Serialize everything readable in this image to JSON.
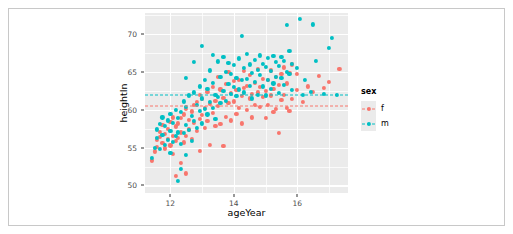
{
  "chart_data": {
    "type": "scatter",
    "title": "",
    "xlabel": "ageYear",
    "ylabel": "heightIn",
    "xlim": [
      11.2,
      17.6
    ],
    "ylim": [
      49.0,
      72.8
    ],
    "xticks": [
      12,
      14,
      16
    ],
    "yticks": [
      50,
      55,
      60,
      65,
      70
    ],
    "grid": true,
    "panel_color": "#ebebeb",
    "grid_color": "#ffffff",
    "legend": {
      "title": "sex",
      "position": "right",
      "entries": [
        {
          "label": "f",
          "color": "#f8766d"
        },
        {
          "label": "m",
          "color": "#00bfc4"
        }
      ]
    },
    "annotations": [
      {
        "kind": "hline",
        "series": "m",
        "y": 62.0,
        "style": "dashed",
        "color": "#00bfc4"
      },
      {
        "kind": "hline",
        "series": "f",
        "y": 60.5,
        "style": "dashed",
        "color": "#f8766d"
      }
    ],
    "series": [
      {
        "name": "f",
        "color": "#f8766d",
        "points": [
          [
            11.42,
            53.3
          ],
          [
            11.5,
            54.5
          ],
          [
            11.58,
            55.1
          ],
          [
            11.58,
            56.0
          ],
          [
            11.67,
            56.4
          ],
          [
            11.67,
            57.1
          ],
          [
            11.75,
            55.6
          ],
          [
            11.75,
            58.0
          ],
          [
            11.83,
            54.9
          ],
          [
            11.83,
            56.8
          ],
          [
            11.92,
            56.2
          ],
          [
            11.92,
            57.5
          ],
          [
            12.0,
            55.3
          ],
          [
            12.0,
            58.4
          ],
          [
            12.08,
            54.2
          ],
          [
            12.08,
            56.6
          ],
          [
            12.08,
            59.0
          ],
          [
            12.17,
            51.3
          ],
          [
            12.17,
            55.9
          ],
          [
            12.17,
            57.8
          ],
          [
            12.25,
            56.3
          ],
          [
            12.25,
            58.2
          ],
          [
            12.33,
            53.0
          ],
          [
            12.33,
            57.0
          ],
          [
            12.33,
            58.9
          ],
          [
            12.42,
            55.7
          ],
          [
            12.42,
            59.4
          ],
          [
            12.5,
            51.6
          ],
          [
            12.5,
            56.5
          ],
          [
            12.5,
            60.1
          ],
          [
            12.58,
            57.4
          ],
          [
            12.58,
            58.7
          ],
          [
            12.67,
            56.1
          ],
          [
            12.67,
            59.8
          ],
          [
            12.75,
            58.3
          ],
          [
            12.75,
            60.6
          ],
          [
            12.83,
            57.2
          ],
          [
            12.83,
            61.0
          ],
          [
            12.92,
            54.6
          ],
          [
            12.92,
            58.8
          ],
          [
            12.92,
            62.0
          ],
          [
            13.0,
            59.3
          ],
          [
            13.0,
            61.4
          ],
          [
            13.08,
            57.6
          ],
          [
            13.08,
            60.2
          ],
          [
            13.17,
            58.5
          ],
          [
            13.17,
            62.4
          ],
          [
            13.25,
            55.4
          ],
          [
            13.25,
            60.8
          ],
          [
            13.33,
            59.6
          ],
          [
            13.33,
            63.0
          ],
          [
            13.42,
            57.9
          ],
          [
            13.42,
            61.2
          ],
          [
            13.5,
            60.5
          ],
          [
            13.5,
            64.3
          ],
          [
            13.58,
            58.1
          ],
          [
            13.58,
            62.7
          ],
          [
            13.67,
            55.2
          ],
          [
            13.67,
            61.6
          ],
          [
            13.75,
            59.1
          ],
          [
            13.75,
            63.4
          ],
          [
            13.83,
            60.9
          ],
          [
            13.83,
            65.0
          ],
          [
            13.92,
            58.6
          ],
          [
            13.92,
            62.2
          ],
          [
            14.0,
            61.1
          ],
          [
            14.0,
            63.8
          ],
          [
            14.08,
            59.5
          ],
          [
            14.08,
            62.6
          ],
          [
            14.17,
            60.3
          ],
          [
            14.17,
            64.0
          ],
          [
            14.25,
            58.2
          ],
          [
            14.25,
            61.8
          ],
          [
            14.33,
            62.9
          ],
          [
            14.33,
            65.1
          ],
          [
            14.42,
            60.0
          ],
          [
            14.42,
            63.2
          ],
          [
            14.5,
            61.5
          ],
          [
            14.5,
            64.6
          ],
          [
            14.58,
            59.0
          ],
          [
            14.58,
            62.1
          ],
          [
            14.67,
            60.7
          ],
          [
            14.67,
            63.6
          ],
          [
            14.75,
            62.3
          ],
          [
            14.75,
            65.4
          ],
          [
            14.83,
            60.4
          ],
          [
            14.83,
            63.0
          ],
          [
            14.92,
            61.7
          ],
          [
            14.92,
            64.1
          ],
          [
            15.0,
            58.9
          ],
          [
            15.0,
            62.5
          ],
          [
            15.08,
            60.6
          ],
          [
            15.08,
            63.9
          ],
          [
            15.17,
            61.9
          ],
          [
            15.17,
            65.2
          ],
          [
            15.25,
            59.7
          ],
          [
            15.25,
            62.8
          ],
          [
            15.33,
            60.1
          ],
          [
            15.33,
            64.4
          ],
          [
            15.42,
            56.9
          ],
          [
            15.42,
            63.3
          ],
          [
            15.5,
            61.3
          ],
          [
            15.5,
            64.8
          ],
          [
            15.58,
            62.0
          ],
          [
            15.58,
            65.6
          ],
          [
            15.67,
            60.2
          ],
          [
            15.67,
            63.5
          ],
          [
            15.75,
            59.9
          ],
          [
            15.75,
            64.9
          ],
          [
            15.83,
            61.4
          ],
          [
            15.83,
            66.0
          ],
          [
            16.0,
            62.6
          ],
          [
            16.0,
            64.7
          ],
          [
            16.17,
            61.0
          ],
          [
            16.33,
            63.1
          ],
          [
            16.5,
            62.4
          ],
          [
            16.67,
            64.5
          ],
          [
            16.83,
            62.9
          ],
          [
            17.0,
            63.7
          ],
          [
            17.33,
            65.4
          ]
        ]
      },
      {
        "name": "m",
        "color": "#00bfc4",
        "points": [
          [
            11.42,
            53.6
          ],
          [
            11.5,
            55.0
          ],
          [
            11.58,
            56.3
          ],
          [
            11.58,
            57.4
          ],
          [
            11.67,
            54.8
          ],
          [
            11.67,
            58.1
          ],
          [
            11.75,
            56.7
          ],
          [
            11.75,
            59.0
          ],
          [
            11.83,
            55.4
          ],
          [
            11.83,
            57.9
          ],
          [
            11.92,
            56.0
          ],
          [
            11.92,
            58.6
          ],
          [
            12.0,
            54.3
          ],
          [
            12.0,
            57.2
          ],
          [
            12.0,
            59.5
          ],
          [
            12.08,
            55.8
          ],
          [
            12.08,
            58.3
          ],
          [
            12.17,
            56.5
          ],
          [
            12.17,
            60.0
          ],
          [
            12.25,
            50.6
          ],
          [
            12.25,
            57.0
          ],
          [
            12.25,
            58.9
          ],
          [
            12.33,
            52.2
          ],
          [
            12.33,
            55.5
          ],
          [
            12.33,
            59.7
          ],
          [
            12.42,
            56.9
          ],
          [
            12.42,
            61.1
          ],
          [
            12.5,
            54.0
          ],
          [
            12.5,
            58.0
          ],
          [
            12.5,
            60.4
          ],
          [
            12.58,
            57.3
          ],
          [
            12.58,
            61.9
          ],
          [
            12.67,
            55.9
          ],
          [
            12.67,
            59.2
          ],
          [
            12.75,
            58.5
          ],
          [
            12.75,
            62.3
          ],
          [
            12.83,
            57.6
          ],
          [
            12.83,
            60.7
          ],
          [
            12.92,
            59.9
          ],
          [
            12.92,
            63.1
          ],
          [
            13.0,
            58.2
          ],
          [
            13.0,
            61.5
          ],
          [
            13.08,
            60.1
          ],
          [
            13.08,
            64.0
          ],
          [
            13.17,
            59.4
          ],
          [
            13.17,
            62.8
          ],
          [
            13.25,
            61.0
          ],
          [
            13.25,
            65.2
          ],
          [
            13.33,
            60.3
          ],
          [
            13.33,
            63.6
          ],
          [
            13.42,
            58.8
          ],
          [
            13.42,
            62.0
          ],
          [
            13.5,
            61.7
          ],
          [
            13.5,
            66.4
          ],
          [
            13.58,
            60.9
          ],
          [
            13.58,
            64.3
          ],
          [
            13.67,
            62.5
          ],
          [
            13.67,
            67.0
          ],
          [
            13.75,
            61.2
          ],
          [
            13.75,
            65.0
          ],
          [
            13.83,
            63.4
          ],
          [
            13.83,
            66.2
          ],
          [
            13.92,
            62.1
          ],
          [
            13.92,
            64.8
          ],
          [
            14.0,
            63.0
          ],
          [
            14.0,
            65.9
          ],
          [
            14.08,
            61.8
          ],
          [
            14.08,
            64.2
          ],
          [
            14.17,
            62.7
          ],
          [
            14.17,
            66.8
          ],
          [
            14.25,
            63.9
          ],
          [
            14.25,
            69.8
          ],
          [
            14.33,
            62.3
          ],
          [
            14.33,
            65.5
          ],
          [
            14.42,
            64.1
          ],
          [
            14.42,
            67.4
          ],
          [
            14.5,
            63.2
          ],
          [
            14.5,
            66.0
          ],
          [
            14.58,
            61.5
          ],
          [
            14.58,
            64.9
          ],
          [
            14.67,
            63.7
          ],
          [
            14.67,
            66.6
          ],
          [
            14.75,
            62.0
          ],
          [
            14.75,
            65.3
          ],
          [
            14.83,
            64.6
          ],
          [
            14.83,
            67.2
          ],
          [
            14.92,
            63.1
          ],
          [
            14.92,
            66.1
          ],
          [
            15.0,
            61.9
          ],
          [
            15.0,
            65.7
          ],
          [
            15.08,
            64.0
          ],
          [
            15.08,
            66.9
          ],
          [
            15.17,
            62.8
          ],
          [
            15.17,
            65.1
          ],
          [
            15.25,
            63.5
          ],
          [
            15.25,
            67.1
          ],
          [
            15.33,
            64.4
          ],
          [
            15.33,
            66.3
          ],
          [
            15.42,
            62.2
          ],
          [
            15.42,
            65.8
          ],
          [
            15.5,
            64.2
          ],
          [
            15.5,
            67.0
          ],
          [
            15.58,
            63.3
          ],
          [
            15.58,
            66.5
          ],
          [
            15.67,
            65.0
          ],
          [
            15.67,
            71.2
          ],
          [
            15.75,
            64.7
          ],
          [
            15.75,
            67.8
          ],
          [
            15.83,
            62.6
          ],
          [
            15.83,
            66.1
          ],
          [
            16.0,
            65.5
          ],
          [
            16.08,
            72.0
          ],
          [
            16.17,
            62.0
          ],
          [
            16.25,
            64.0
          ],
          [
            16.42,
            62.4
          ],
          [
            16.5,
            71.3
          ],
          [
            16.58,
            66.5
          ],
          [
            16.83,
            62.1
          ],
          [
            17.0,
            68.2
          ],
          [
            17.08,
            69.5
          ],
          [
            17.25,
            62.0
          ],
          [
            13.0,
            68.4
          ],
          [
            12.75,
            66.3
          ],
          [
            13.33,
            67.3
          ],
          [
            12.5,
            64.2
          ]
        ]
      }
    ]
  }
}
